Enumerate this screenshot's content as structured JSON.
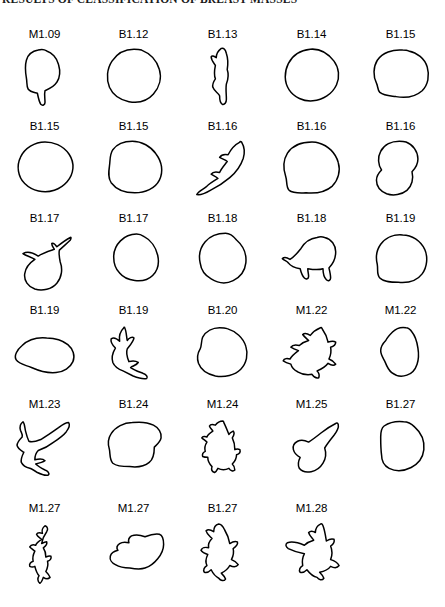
{
  "figure": {
    "title": "RESULTS OF CLASSIFICATION OF BREAST MASSES",
    "rows": 6,
    "columns": 5,
    "specimen_count": 30,
    "stroke_color": "#000000",
    "background_color": "#ffffff",
    "specimens": [
      {
        "label": "M1.09",
        "class": "M",
        "index": "1.09",
        "outline": "M 34,6 C 28,7 22,11 20,18 C 18,25 19,33 20,39 C 21,44 20,48 22,52 C 25,56 30,56 33,57 C 34,62 35,67 37,70 C 39,72 42,71 42,68 C 42,63 41,58 42,54 C 47,52 53,49 56,44 C 60,38 60,30 58,23 C 56,15 50,9 44,7 C 41,5 37,5 34,6 Z"
      },
      {
        "label": "B1.12",
        "class": "B",
        "index": "1.12",
        "outline": "M 42,5 C 32,5 22,10 16,19 C 10,28 9,40 13,50 C 17,59 26,65 36,67 C 47,69 58,66 65,58 C 72,50 75,39 72,29 C 69,18 61,10 51,6 C 48,5 45,5 42,5 Z"
      },
      {
        "label": "B1.13",
        "class": "B",
        "index": "1.13",
        "outline": "M 40,4 C 36,7 34,11 34,15 C 31,13 29,12 28,14 C 28,18 31,21 33,24 C 32,29 31,35 33,40 C 31,43 29,46 30,50 C 32,55 36,56 38,60 C 38,64 38,68 41,70 C 44,71 46,68 46,64 C 46,58 45,52 46,46 C 48,41 49,35 47,29 C 48,23 48,16 46,10 C 45,6 43,3 40,4 Z"
      },
      {
        "label": "B1.14",
        "class": "B",
        "index": "1.14",
        "outline": "M 40,5 C 29,6 19,12 14,22 C 9,32 9,44 15,53 C 21,62 32,67 43,66 C 55,65 66,58 71,47 C 75,38 74,27 68,19 C 61,10 51,4 40,5 Z"
      },
      {
        "label": "B1.15",
        "class": "B",
        "index": "1.15",
        "outline": "M 44,6 C 32,5 20,9 14,18 C 9,26 9,37 13,45 C 15,49 14,53 17,56 C 22,60 29,60 36,61 C 47,63 59,61 67,54 C 74,47 76,36 73,26 C 70,16 61,9 51,7 C 49,6 46,6 44,6 Z"
      },
      {
        "label": "B1.15",
        "class": "B",
        "index": "1.15",
        "outline": "M 42,6 C 30,6 18,13 13,24 C 8,34 10,47 18,55 C 27,64 41,67 53,63 C 65,59 74,49 75,37 C 76,25 68,14 57,9 C 52,7 47,6 42,6 Z"
      },
      {
        "label": "B1.15",
        "class": "B",
        "index": "1.15",
        "outline": "M 40,5 C 31,5 22,8 17,15 C 13,21 14,28 13,34 C 12,41 11,48 15,54 C 21,62 32,66 43,66 C 55,66 67,61 72,51 C 77,41 75,29 68,20 C 62,11 51,5 40,5 Z"
      },
      {
        "label": "B1.16",
        "class": "B",
        "index": "1.16",
        "outline": "M 62,6 C 56,9 51,15 48,21 C 44,20 40,21 38,24 C 41,26 45,27 47,29 C 44,33 40,37 38,42 C 34,41 30,41 28,44 C 31,46 34,47 36,49 C 31,52 26,55 22,59 C 18,62 13,64 11,68 C 16,69 22,66 27,63 C 35,59 43,54 50,48 C 57,42 63,34 66,25 C 68,18 67,11 64,6 C 63,5 62,5 62,6 Z"
      },
      {
        "label": "B1.16",
        "class": "B",
        "index": "1.16",
        "outline": "M 42,6 C 30,6 19,10 13,19 C 8,27 8,38 11,47 C 13,53 11,59 15,63 C 20,67 28,66 35,66 C 46,67 58,65 66,58 C 73,51 76,40 73,30 C 70,19 61,10 50,7 C 47,6 45,6 42,6 Z"
      },
      {
        "label": "B1.16",
        "class": "B",
        "index": "1.16",
        "outline": "M 40,5 C 31,5 22,9 18,17 C 14,24 15,33 19,39 C 16,42 13,46 13,51 C 13,58 18,64 25,67 C 33,70 43,68 49,63 C 55,58 57,49 55,41 C 59,37 62,32 62,26 C 62,17 56,9 48,6 C 45,5 42,5 40,5 Z"
      },
      {
        "label": "B1.17",
        "class": "B",
        "index": "1.17",
        "outline": "M 72,10 C 66,13 61,17 56,21 C 54,18 52,16 50,17 C 50,20 52,22 53,24 C 47,26 40,28 34,32 C 28,28 21,26 16,29 C 20,32 26,33 30,36 C 24,40 19,46 18,53 C 17,61 22,68 30,71 C 39,74 50,71 56,64 C 62,57 63,47 60,39 C 59,34 58,29 59,25 C 63,21 68,17 72,13 C 73,11 73,9 72,10 Z"
      },
      {
        "label": "B1.17",
        "class": "B",
        "index": "1.17",
        "outline": "M 45,6 C 38,6 31,9 26,14 C 21,19 18,26 18,33 C 18,40 20,47 25,52 C 29,57 36,60 43,61 C 51,62 59,60 64,55 C 70,49 72,40 70,31 C 68,22 62,13 54,9 C 51,7 48,6 45,6 Z"
      },
      {
        "label": "B1.18",
        "class": "B",
        "index": "1.18",
        "outline": "M 45,5 C 36,5 27,8 21,15 C 15,22 13,31 15,40 C 16,48 21,55 28,59 C 36,64 46,65 54,61 C 62,57 68,49 69,40 C 70,30 66,20 58,13 C 54,8 50,5 45,5 Z"
      },
      {
        "label": "B1.18",
        "class": "B",
        "index": "1.18",
        "outline": "M 48,10 C 40,11 33,16 29,23 C 25,28 21,33 16,36 C 13,34 9,33 7,35 C 9,37 12,38 14,40 C 17,44 22,46 28,47 C 29,51 30,55 33,58 C 35,60 38,59 38,56 C 38,53 37,50 37,47 C 43,48 49,49 55,47 C 55,52 56,57 59,60 C 61,62 64,61 64,58 C 64,54 63,50 62,46 C 67,41 70,34 70,27 C 70,19 65,12 57,10 C 54,9 51,9 48,10 Z"
      },
      {
        "label": "B1.19",
        "class": "B",
        "index": "1.19",
        "outline": "M 44,7 C 34,6 24,10 18,18 C 13,25 12,34 14,42 C 15,48 13,54 17,58 C 22,63 31,63 39,63 C 50,64 61,61 67,53 C 73,45 74,33 70,24 C 65,14 55,7 44,7 Z"
      },
      {
        "label": "B1.19",
        "class": "B",
        "index": "1.19",
        "outline": "M 44,20 C 33,19 22,22 15,29 C 9,34 5,41 8,46 C 11,51 19,52 26,55 C 35,59 45,62 55,61 C 64,60 72,55 75,48 C 78,41 75,33 69,28 C 62,22 53,20 44,20 Z"
      },
      {
        "label": "B1.19",
        "class": "B",
        "index": "1.19",
        "outline": "M 30,8 C 26,12 24,18 25,24 C 22,21 18,19 15,21 C 14,25 17,29 20,32 C 17,37 15,43 17,49 C 19,54 24,57 29,59 C 33,61 37,63 41,65 C 46,67 52,69 57,68 C 59,66 56,63 53,62 C 48,60 42,58 38,55 C 41,53 45,52 47,49 C 44,47 40,47 36,48 C 34,43 32,38 34,33 C 37,29 41,25 42,20 C 40,18 36,20 34,23 C 33,18 33,12 31,8 C 31,7 30,7 30,8 Z"
      },
      {
        "label": "B1.20",
        "class": "B",
        "index": "1.20",
        "outline": "M 38,8 C 30,8 22,12 18,19 C 16,24 17,29 15,33 C 12,38 11,44 13,50 C 16,58 24,63 33,65 C 44,67 56,64 63,57 C 70,50 72,39 69,30 C 66,20 57,12 47,9 C 44,8 41,8 38,8 Z"
      },
      {
        "label": "M1.22",
        "class": "M",
        "index": "1.22",
        "outline": "M 52,8 C 47,10 43,13 40,17 C 37,15 33,14 31,16 C 33,19 36,21 38,23 C 34,24 30,26 27,29 C 23,28 19,28 17,31 C 20,33 23,34 26,35 C 22,38 18,41 16,45 C 13,44 9,44 8,47 C 11,49 14,50 17,51 C 18,55 21,58 25,60 C 30,63 36,64 42,63 C 44,66 47,68 50,67 C 51,64 50,61 48,59 C 53,57 58,54 61,50 C 64,52 68,53 70,51 C 68,48 65,46 62,45 C 64,41 65,36 64,31 C 67,30 70,28 70,25 C 67,23 64,24 61,25 C 60,20 58,15 55,11 C 54,9 53,7 52,8 Z"
      },
      {
        "label": "M1.22",
        "class": "M",
        "index": "1.22",
        "outline": "M 48,8 C 42,7 36,9 32,13 C 29,16 26,19 24,23 C 21,26 18,30 18,35 C 18,40 21,44 23,48 C 25,53 27,58 31,61 C 36,65 43,66 49,64 C 55,62 59,57 61,51 C 63,45 63,38 62,32 C 61,25 59,18 55,13 C 53,10 51,8 48,8 Z"
      },
      {
        "label": "M1.23",
        "class": "M",
        "index": "1.23",
        "outline": "M 16,8 C 13,10 12,14 13,18 C 14,21 16,23 15,26 C 12,29 9,32 9,36 C 10,40 14,42 17,44 C 15,48 13,52 14,56 C 16,60 20,62 24,63 C 27,64 30,66 33,68 C 37,70 42,72 46,71 C 48,69 45,66 42,65 C 38,63 34,61 31,58 C 35,57 39,56 42,54 C 39,51 34,52 30,53 C 30,49 31,45 34,42 C 40,40 46,37 51,33 C 57,29 63,25 67,20 C 70,16 72,12 70,9 C 66,9 62,12 58,15 C 51,20 44,25 37,29 C 32,31 27,33 23,31 C 21,27 20,23 19,19 C 18,15 18,10 16,8 Z"
      },
      {
        "label": "B1.24",
        "class": "B",
        "index": "1.24",
        "outline": "M 40,9 C 30,9 20,14 15,22 C 11,28 11,35 13,41 C 14,47 13,53 17,57 C 22,61 30,61 37,61 C 45,62 54,61 60,56 C 65,52 66,45 66,38 C 69,35 73,32 74,27 C 75,21 71,15 65,12 C 57,8 48,8 40,9 Z"
      },
      {
        "label": "M1.24",
        "class": "M",
        "index": "1.24",
        "outline": "M 42,7 C 38,7 35,9 33,12 C 30,11 27,11 26,13 C 27,16 29,17 30,19 C 27,21 24,23 23,26 C 21,25 18,25 17,27 C 19,29 21,30 23,32 C 21,35 20,39 21,43 C 19,44 17,46 18,49 C 20,50 22,50 24,50 C 24,54 26,58 29,61 C 28,64 29,67 32,68 C 34,67 35,65 36,63 C 40,65 45,65 49,63 C 51,66 54,67 56,65 C 56,62 55,60 53,58 C 56,55 58,51 58,47 C 61,46 63,44 62,41 C 60,40 58,40 56,41 C 56,36 55,31 53,27 C 55,24 56,21 54,19 C 52,20 50,21 49,23 C 47,18 45,13 43,9 C 43,8 42,7 42,7 Z"
      },
      {
        "label": "M1.25",
        "class": "M",
        "index": "1.25",
        "outline": "M 70,10 C 64,13 58,17 53,21 C 48,25 43,29 38,32 C 34,30 29,29 25,31 C 21,33 19,37 20,41 C 21,45 24,48 28,50 C 26,54 25,59 27,63 C 30,67 36,68 41,67 C 47,66 52,62 55,57 C 58,52 59,45 57,39 C 60,34 64,29 68,24 C 71,20 74,15 73,11 C 72,9 71,9 70,10 Z"
      },
      {
        "label": "B1.27",
        "class": "B",
        "index": "1.27",
        "outline": "M 45,8 C 36,7 28,9 22,13 C 18,16 18,21 18,26 C 18,33 18,40 19,47 C 19,54 22,60 28,63 C 36,67 46,66 54,62 C 62,58 68,50 69,41 C 70,31 66,21 58,14 C 54,10 50,8 45,8 Z"
      },
      {
        "label": "M1.27",
        "class": "M",
        "index": "1.27",
        "outline": "M 42,8 C 39,10 38,14 39,17 C 36,16 33,16 32,18 C 33,21 36,22 38,24 C 35,26 32,28 31,31 C 28,30 25,31 24,33 C 26,35 28,36 30,38 C 28,42 27,46 28,50 C 25,51 23,53 24,56 C 26,57 28,57 30,56 C 31,60 32,64 35,67 C 33,70 33,74 36,76 C 38,75 39,72 40,69 C 43,71 46,71 48,69 C 47,66 45,64 43,62 C 45,58 46,54 45,50 C 48,49 50,47 49,44 C 47,43 45,44 43,45 C 43,41 42,37 40,34 C 43,32 45,30 44,27 C 42,27 40,28 38,29 C 39,24 41,19 44,15 C 46,12 45,9 42,8 Z"
      },
      {
        "label": "M1.27",
        "class": "M",
        "index": "1.27",
        "outline": "M 72,18 C 66,17 60,19 55,21 C 50,19 44,18 39,20 C 36,22 35,25 36,28 C 32,27 28,27 25,29 C 22,31 21,34 23,37 C 19,38 15,40 14,44 C 13,48 16,52 20,54 C 25,57 31,58 37,58 C 43,59 49,60 55,58 C 61,56 66,52 70,47 C 74,42 77,36 77,30 C 77,24 75,19 72,18 Z"
      },
      {
        "label": "B1.27",
        "class": "B",
        "index": "1.27",
        "outline": "M 37,6 C 33,7 31,11 31,15 C 28,13 24,12 22,14 C 23,18 26,20 29,23 C 26,26 24,30 25,34 C 21,33 17,34 16,37 C 18,40 21,41 24,42 C 22,46 21,51 23,55 C 20,57 18,60 20,63 C 23,64 26,62 28,60 C 30,64 33,68 37,70 C 39,73 43,74 45,71 C 44,68 42,66 40,64 C 44,62 48,59 50,55 C 54,57 58,57 60,54 C 58,51 55,49 52,48 C 54,44 55,39 54,35 C 57,33 60,30 59,27 C 56,26 53,27 50,29 C 49,23 47,18 44,13 C 42,9 40,6 37,6 Z"
      },
      {
        "label": "M1.28",
        "class": "M",
        "index": "1.28",
        "outline": "M 52,6 C 48,8 46,12 46,16 C 43,14 40,14 38,16 C 39,20 42,22 44,25 C 40,26 36,28 33,31 C 26,28 19,26 13,28 C 10,30 11,33 14,35 C 20,38 27,40 33,41 C 31,45 30,50 31,55 C 28,57 26,60 28,63 C 31,64 34,62 36,60 C 39,64 43,68 48,69 C 50,72 54,73 56,70 C 55,67 53,65 51,63 C 56,62 61,60 64,56 C 68,58 72,58 74,55 C 72,51 68,49 64,48 C 66,43 66,37 64,32 C 67,30 69,27 68,24 C 65,23 62,24 59,26 C 58,20 57,13 55,8 C 54,6 53,5 52,6 Z"
      }
    ]
  }
}
